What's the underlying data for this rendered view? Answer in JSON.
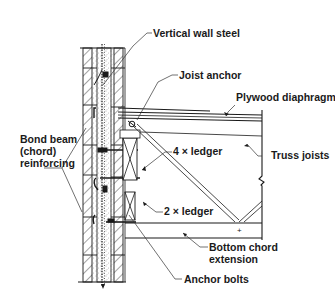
{
  "diagram": {
    "title": "",
    "labels": {
      "vertical_wall_steel": "Vertical wall steel",
      "joist_anchor": "Joist anchor",
      "plywood_diaphragm": "Plywood diaphragm",
      "truss_joists": "Truss joists",
      "ledger_4x": "4 × ledger",
      "ledger_2x": "2 × ledger",
      "bond_beam_line1": "Bond beam",
      "bond_beam_line2": "(chord)",
      "bond_beam_line3": "reinforcing",
      "bottom_chord_line1": "Bottom chord",
      "bottom_chord_line2": "extension",
      "anchor_bolts": "Anchor bolts"
    },
    "colors": {
      "ink": "#1a1a1a",
      "background": "#ffffff",
      "grout_stipple": "#555555"
    }
  }
}
